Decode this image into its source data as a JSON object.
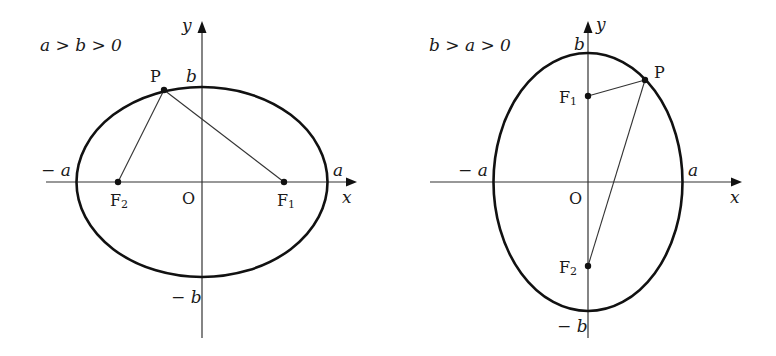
{
  "diagrams": [
    {
      "condition": "a > b > 0",
      "axis_labels": {
        "x": "x",
        "y": "y",
        "origin": "O"
      },
      "intercepts": {
        "pos_x": "a",
        "neg_x": "− a",
        "pos_y": "b",
        "neg_y": "− b"
      },
      "points": {
        "P": "P",
        "F1": {
          "base": "F",
          "sub": "1"
        },
        "F2": {
          "base": "F",
          "sub": "2"
        }
      },
      "orientation": "horizontal major axis"
    },
    {
      "condition": "b > a > 0",
      "axis_labels": {
        "x": "x",
        "y": "y",
        "origin": "O"
      },
      "intercepts": {
        "pos_x": "a",
        "neg_x": "− a",
        "pos_y": "b",
        "neg_y": "− b"
      },
      "points": {
        "P": "P",
        "F1": {
          "base": "F",
          "sub": "1"
        },
        "F2": {
          "base": "F",
          "sub": "2"
        }
      },
      "orientation": "vertical major axis"
    }
  ],
  "colors": {
    "stroke": "#111111",
    "background": "#ffffff"
  }
}
